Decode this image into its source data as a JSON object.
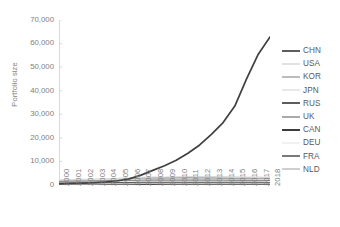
{
  "chart_data": {
    "type": "line",
    "title": "",
    "xlabel": "",
    "ylabel": "Portfolio size",
    "ylim": [
      0,
      70000
    ],
    "ytick_labels": [
      "70,000",
      "60,000",
      "50,000",
      "40,000",
      "30,000",
      "20,000",
      "10,000",
      "0"
    ],
    "ytick_values": [
      70000,
      60000,
      50000,
      40000,
      30000,
      20000,
      10000,
      0
    ],
    "grid": false,
    "legend_position": "right",
    "x": [
      2000,
      2001,
      2002,
      2003,
      2004,
      2005,
      2006,
      2007,
      2008,
      2009,
      2010,
      2011,
      2012,
      2013,
      2014,
      2015,
      2016,
      2017,
      2018
    ],
    "xtick_labels": [
      "2000",
      "2001",
      "2002",
      "2003",
      "2004",
      "2005",
      "2006",
      "2007",
      "2008",
      "2009",
      "2010",
      "2011",
      "2012",
      "2013",
      "2014",
      "2015",
      "2016",
      "2017",
      "2018"
    ],
    "series": [
      {
        "name": "CHN",
        "color": "#404040",
        "width": 1.7,
        "values": [
          500,
          650,
          800,
          1000,
          1300,
          1800,
          2600,
          4200,
          6200,
          8200,
          10500,
          13500,
          17000,
          21500,
          26500,
          33500,
          45000,
          55500,
          62800
        ]
      },
      {
        "name": "USA",
        "color": "#d9d9d9",
        "width": 1.5,
        "values": [
          2100,
          2200,
          2300,
          2400,
          2600,
          2800,
          3000,
          3200,
          3300,
          3300,
          3400,
          3500,
          3500,
          3500,
          3500,
          3400,
          3300,
          3300,
          3200
        ]
      },
      {
        "name": "KOR",
        "color": "#a6a6a6",
        "width": 1.5,
        "values": [
          1200,
          1350,
          1500,
          1700,
          1900,
          2100,
          2400,
          2700,
          2900,
          2900,
          3000,
          3100,
          3000,
          2950,
          2900,
          2800,
          2750,
          2700,
          2650
        ]
      },
      {
        "name": "JPN",
        "color": "#e0e0e0",
        "width": 1.5,
        "values": [
          1800,
          1850,
          1900,
          1950,
          2000,
          2100,
          2200,
          2350,
          2400,
          2350,
          2400,
          2400,
          2350,
          2300,
          2250,
          2200,
          2150,
          2100,
          2050
        ]
      },
      {
        "name": "RUS",
        "color": "#3f3f3f",
        "width": 1.7,
        "values": [
          300,
          330,
          360,
          400,
          450,
          500,
          560,
          620,
          680,
          700,
          740,
          780,
          800,
          820,
          840,
          850,
          860,
          870,
          880
        ]
      },
      {
        "name": "UK",
        "color": "#8c8c8c",
        "width": 1.5,
        "values": [
          1500,
          1550,
          1600,
          1650,
          1700,
          1780,
          1850,
          1950,
          2000,
          1980,
          2000,
          2020,
          2000,
          1980,
          1950,
          1900,
          1880,
          1850,
          1820
        ]
      },
      {
        "name": "CAN",
        "color": "#262626",
        "width": 1.8,
        "values": [
          200,
          220,
          240,
          260,
          290,
          320,
          360,
          400,
          430,
          440,
          460,
          480,
          490,
          500,
          505,
          510,
          515,
          520,
          525
        ]
      },
      {
        "name": "DEU",
        "color": "#ededed",
        "width": 1.5,
        "values": [
          1000,
          1050,
          1100,
          1150,
          1220,
          1300,
          1380,
          1460,
          1500,
          1480,
          1500,
          1510,
          1500,
          1480,
          1460,
          1430,
          1410,
          1390,
          1370
        ]
      },
      {
        "name": "FRA",
        "color": "#595959",
        "width": 1.6,
        "values": [
          700,
          730,
          760,
          800,
          850,
          900,
          960,
          1020,
          1060,
          1050,
          1070,
          1080,
          1070,
          1060,
          1040,
          1020,
          1000,
          990,
          980
        ]
      },
      {
        "name": "NLD",
        "color": "#bfbfbf",
        "width": 1.5,
        "values": [
          400,
          420,
          440,
          470,
          500,
          540,
          580,
          620,
          650,
          650,
          670,
          680,
          675,
          670,
          660,
          650,
          645,
          640,
          635
        ]
      }
    ]
  },
  "axis": {
    "y_title": "Portfolio size"
  }
}
